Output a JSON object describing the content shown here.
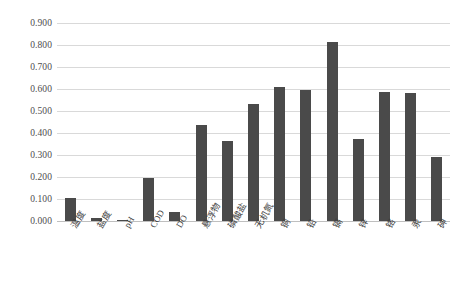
{
  "chart_data": {
    "type": "bar",
    "title": "",
    "subtitle": "",
    "xlabel": "",
    "ylabel": "",
    "ylim": [
      0.0,
      0.9
    ],
    "y_tick_step": 0.1,
    "y_ticks": [
      "0.000",
      "0.100",
      "0.200",
      "0.300",
      "0.400",
      "0.500",
      "0.600",
      "0.700",
      "0.800",
      "0.900"
    ],
    "y_tick_values": [
      0.0,
      0.1,
      0.2,
      0.3,
      0.4,
      0.5,
      0.6,
      0.7,
      0.8,
      0.9
    ],
    "grid": true,
    "grid_axis": "y",
    "legend": false,
    "legend_position": "none",
    "categories": [
      "温度",
      "盐度",
      "pH",
      "COD",
      "DO",
      "悬浮物",
      "磷酸盐",
      "无机氮",
      "铜",
      "铅",
      "镉",
      "锌",
      "铬",
      "汞",
      "砷"
    ],
    "values": [
      0.105,
      0.012,
      0.003,
      0.197,
      0.04,
      0.437,
      0.363,
      0.533,
      0.607,
      0.597,
      0.815,
      0.375,
      0.588,
      0.583,
      0.292
    ],
    "bar_color": "#4a4a4a",
    "grid_color": "#d9d9d9",
    "axis_color": "#bfbfbf",
    "background_color": "#ffffff",
    "label_rotation_deg": -60
  }
}
